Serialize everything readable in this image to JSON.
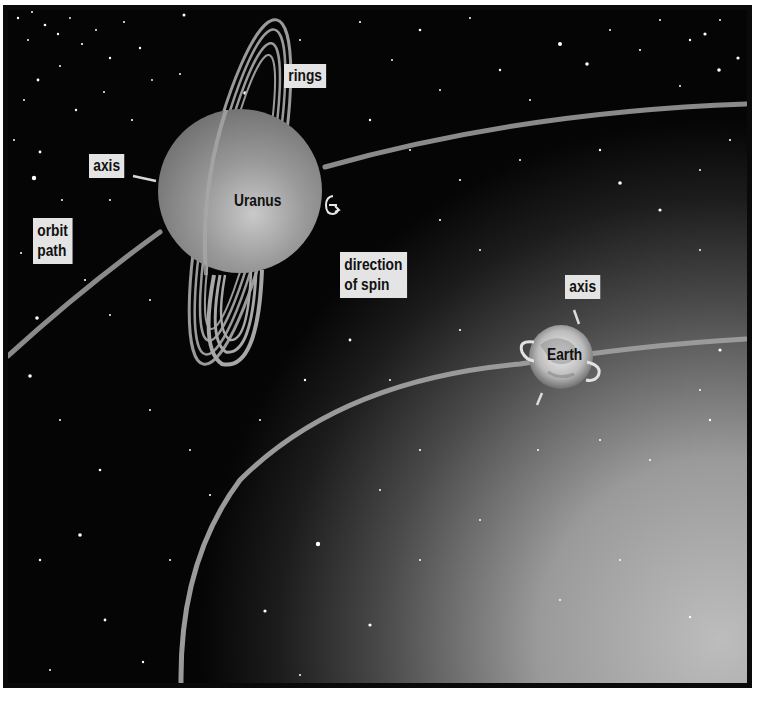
{
  "diagram": {
    "colors": {
      "space": "#050505",
      "glow": "#b8b8b8",
      "orbit": "#8c8c8c",
      "uranus": "#8f8f8f",
      "label_bg": "#e4e4e4",
      "frame": "#0a0a0a"
    },
    "labels": {
      "rings": "rings",
      "uranus_axis": "axis",
      "orbit_path_line1": "orbit",
      "orbit_path_line2": "path",
      "uranus": "Uranus",
      "direction_of_spin_line1": "direction",
      "direction_of_spin_line2": "of spin",
      "earth_axis": "axis",
      "earth": "Earth"
    },
    "bodies": [
      {
        "name": "Uranus",
        "cx": 240,
        "cy": 191,
        "r": 82,
        "axis_tilt": "sideways (~98°)"
      },
      {
        "name": "Earth",
        "cx": 561,
        "cy": 357,
        "r": 32,
        "axis_tilt": "slight tilt"
      }
    ],
    "icons": {
      "spin_arrow": "curved-arrow",
      "earth_spin_arrows": "circular-arrows"
    }
  }
}
